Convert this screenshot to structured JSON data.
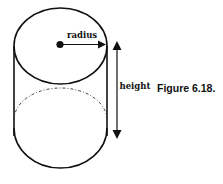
{
  "figure": {
    "caption": "Figure 6.18.",
    "shape": "cylinder",
    "labels": {
      "radius": "radius",
      "height": "height"
    },
    "colors": {
      "stroke": "#111111",
      "background": "#ffffff"
    }
  }
}
